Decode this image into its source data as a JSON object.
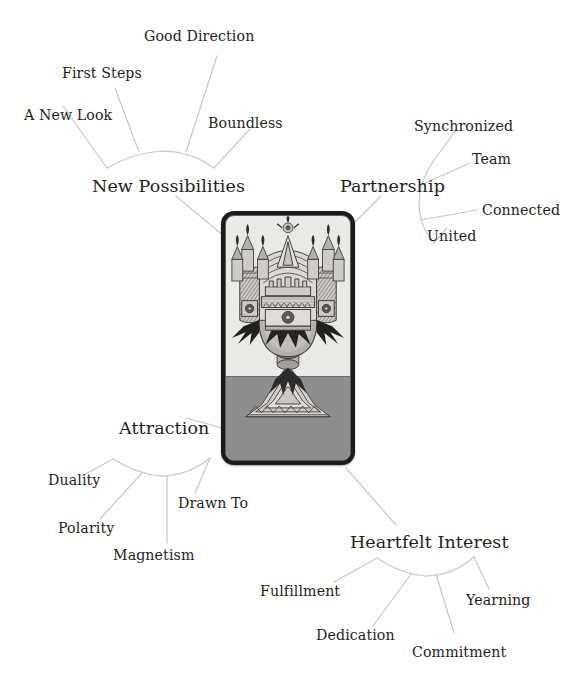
{
  "diagram": {
    "type": "mind-map",
    "center": {
      "name": "ace-of-cups-card",
      "description": "Marseille-style Ace of Cups tarot card illustration",
      "card_border_color": "#1b1b1b",
      "card_background_color": "#e9e9e6",
      "card_ground_color": "#8e8e8e"
    },
    "line_color": "#c9c9c9",
    "text_color": "#1f1d1d",
    "background_color": "#ffffff",
    "branches": [
      {
        "id": "new-possibilities",
        "label": "New Possibilities",
        "position": "upper-left",
        "leaves": [
          {
            "label": "A New Look"
          },
          {
            "label": "First Steps"
          },
          {
            "label": "Good Direction"
          },
          {
            "label": "Boundless"
          }
        ]
      },
      {
        "id": "partnership",
        "label": "Partnership",
        "position": "upper-right",
        "leaves": [
          {
            "label": "Synchronized"
          },
          {
            "label": "Team"
          },
          {
            "label": "Connected"
          },
          {
            "label": "United"
          }
        ]
      },
      {
        "id": "attraction",
        "label": "Attraction",
        "position": "lower-left",
        "leaves": [
          {
            "label": "Duality"
          },
          {
            "label": "Polarity"
          },
          {
            "label": "Magnetism"
          },
          {
            "label": "Drawn To"
          }
        ]
      },
      {
        "id": "heartfelt-interest",
        "label": "Heartfelt Interest",
        "position": "lower-right",
        "leaves": [
          {
            "label": "Fulfillment"
          },
          {
            "label": "Dedication"
          },
          {
            "label": "Commitment"
          },
          {
            "label": "Yearning"
          }
        ]
      }
    ]
  }
}
